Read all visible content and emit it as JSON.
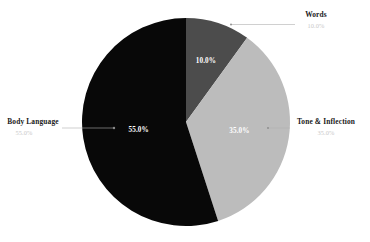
{
  "chart_data": {
    "type": "pie",
    "title": "",
    "subtitle": "",
    "xlabel": "",
    "ylabel": "",
    "legend_position": "none",
    "grid": false,
    "categories": [
      "Words",
      "Tone & Inflection",
      "Body Language"
    ],
    "values": [
      10.0,
      35.0,
      55.0
    ],
    "start_angle_deg": 0,
    "direction": "clockwise",
    "slices": [
      {
        "label": "Words",
        "value": 10.0,
        "value_label": "10.0%",
        "callout_sub_label": "10.0%",
        "color": "#4c4c4c",
        "inner_label_color": "#ffffff"
      },
      {
        "label": "Tone & Inflection",
        "value": 35.0,
        "value_label": "35.0%",
        "callout_sub_label": "35.0%",
        "color": "#bcbcbc",
        "inner_label_color": "#ffffff"
      },
      {
        "label": "Body Language",
        "value": 55.0,
        "value_label": "55.0%",
        "callout_sub_label": "55.0%",
        "color": "#080808",
        "inner_label_color": "#ffffff"
      }
    ]
  },
  "colors": {
    "background": "#ffffff",
    "words_slice": "#4c4c4c",
    "tone_slice": "#bcbcbc",
    "body_language_slice": "#080808",
    "callout_title": "#1a1a1a",
    "callout_sub": "#c9c9c9",
    "leader_line": "#b0b0b0"
  },
  "callouts": {
    "words": {
      "title": "Words",
      "sub": "10.0%"
    },
    "tone": {
      "title": "Tone & Inflection",
      "sub": "35.0%"
    },
    "body_language": {
      "title": "Body Language",
      "sub": "55.0%"
    }
  },
  "inner_labels": {
    "words": "10.0%",
    "tone": "35.0%",
    "body_language": "55.0%"
  }
}
